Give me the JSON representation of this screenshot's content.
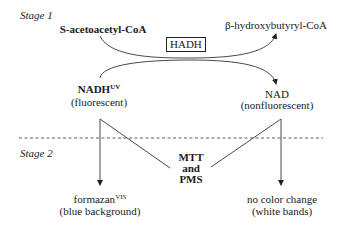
{
  "diagram": {
    "stage1": {
      "label": "Stage 1",
      "substrate": "S-acetoacetyl-CoA",
      "enzyme": "HADH",
      "product": "β-hydroxybutyryl-CoA",
      "cofactor_in": {
        "name": "NADH",
        "superscript": "UV",
        "note": "(fluorescent)"
      },
      "cofactor_out": {
        "name": "NAD",
        "note": "(nonfluorescent)"
      }
    },
    "stage2": {
      "label": "Stage 2",
      "reagents": [
        "MTT",
        "and",
        "PMS"
      ],
      "left_product": {
        "name": "formazan",
        "superscript": "VIS",
        "note": "(blue background)"
      },
      "right_product": {
        "name": "no color change",
        "note": "(white bands)"
      }
    },
    "colors": {
      "line": "#333333",
      "text": "#1a1a1a",
      "background": "#ffffff"
    }
  }
}
